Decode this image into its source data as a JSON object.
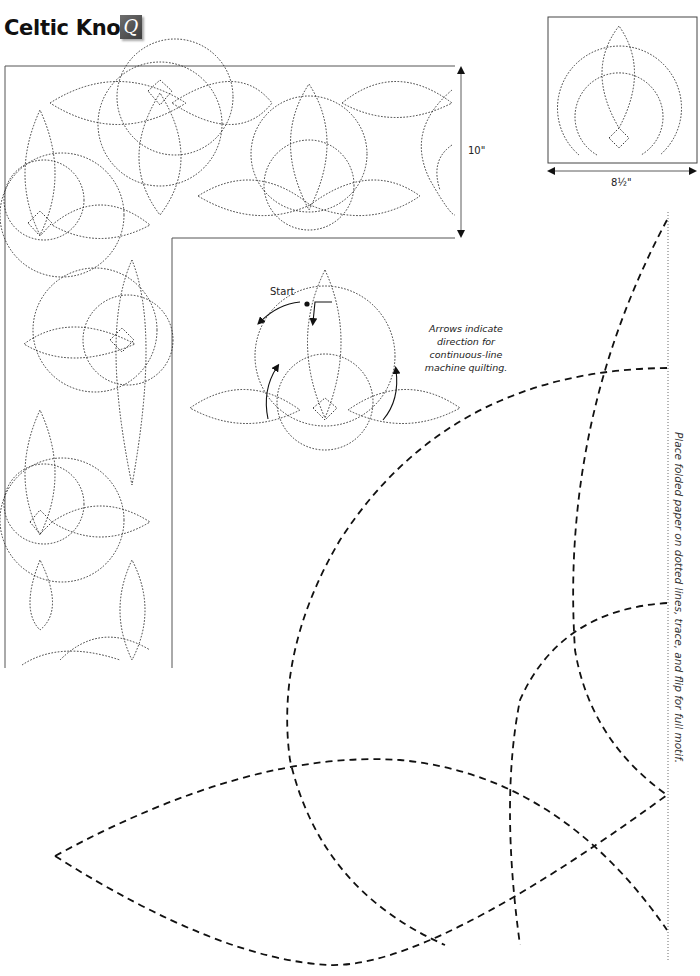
{
  "page": {
    "title": "Celtic Knot",
    "logo_glyph": "Q",
    "logo_icon": "quilt-logo-icon"
  },
  "border_pattern": {
    "height_label": "10\"",
    "description": "corner border quilting pattern"
  },
  "block_pattern": {
    "width_label": "8½\"",
    "description": "single block quilting motif"
  },
  "stitch_guide": {
    "start_label": "Start",
    "note_lines": [
      "Arrows indicate",
      "direction for",
      "continuous-line",
      "machine quilting."
    ]
  },
  "full_size_template": {
    "instruction": "Place folded paper on dotted lines, trace, and flip for full motif."
  },
  "colors": {
    "ink": "#111111",
    "frame": "#555555",
    "background": "#ffffff"
  }
}
